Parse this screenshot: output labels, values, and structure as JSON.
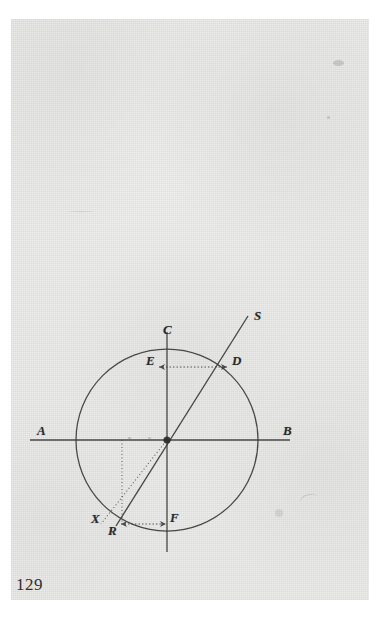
{
  "page": {
    "folio": "129",
    "background_color": "#eeeeec",
    "ink_color": "#2a2a2a",
    "scan_border_color": "#ffffff"
  },
  "figure": {
    "kind": "geometric-circle-diagram",
    "labels": [
      {
        "id": "A",
        "text": "A",
        "x": 37,
        "y": 431,
        "size": 13,
        "note": "left end of horizontal axis"
      },
      {
        "id": "B",
        "text": "B",
        "x": 283,
        "y": 431,
        "size": 13,
        "note": "right end of horizontal axis"
      },
      {
        "id": "C",
        "text": "C",
        "x": 163,
        "y": 330,
        "size": 13,
        "note": "top of vertical axis on circle"
      },
      {
        "id": "D",
        "text": "D",
        "x": 232,
        "y": 360,
        "size": 13,
        "note": "intersection of oblique line with circle"
      },
      {
        "id": "E",
        "text": "E",
        "x": 146,
        "y": 360,
        "size": 13,
        "note": "point on vertical axis level with D"
      },
      {
        "id": "F",
        "text": "F",
        "x": 170,
        "y": 514,
        "size": 13,
        "note": "point on vertical axis level with R"
      },
      {
        "id": "R",
        "text": "R",
        "x": 108,
        "y": 529,
        "size": 13,
        "note": "point on circle, lower left"
      },
      {
        "id": "S",
        "text": "S",
        "x": 254,
        "y": 315,
        "size": 13,
        "note": "far end of the oblique ray"
      },
      {
        "id": "X",
        "text": "X",
        "x": 91,
        "y": 515,
        "size": 13,
        "note": "point on circle to the left of R"
      }
    ],
    "geometry": {
      "circle": {
        "cx": 167,
        "cy": 440,
        "r": 91
      },
      "horizontal_axis": {
        "x1": 30,
        "y1": 440,
        "x2": 290,
        "y2": 440,
        "label_start": "A",
        "label_end": "B"
      },
      "vertical_axis": {
        "x1": 167,
        "y1": 332,
        "x2": 167,
        "y2": 552,
        "label_top": "C",
        "label_bottom": "F"
      },
      "oblique_ray": {
        "x1": 116,
        "y1": 525,
        "x2": 247,
        "y2": 317,
        "through": "centre",
        "label_end": "S",
        "crosses_circle_at": "D"
      },
      "dotted_segments": [
        {
          "name": "vertical-projection-to-X",
          "x1": 122,
          "y1": 440,
          "x2": 122,
          "y2": 524
        },
        {
          "name": "centre-to-X",
          "x1": 167,
          "y1": 440,
          "x2": 101,
          "y2": 524
        }
      ],
      "measure_arrows": [
        {
          "name": "E-to-D",
          "x1": 158,
          "y1": 367,
          "x2": 228,
          "y2": 367,
          "style": "dotted-double-headed"
        },
        {
          "name": "R-to-F",
          "x1": 120,
          "y1": 524,
          "x2": 167,
          "y2": 524,
          "style": "dotted-double-headed"
        }
      ]
    }
  }
}
